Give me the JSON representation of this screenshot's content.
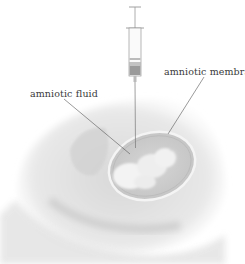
{
  "diagram": {
    "labels": [
      {
        "id": "amniotic-fluid",
        "text": "amniotic fluid"
      },
      {
        "id": "amniotic-membranes",
        "text": "amniotic membranes"
      }
    ],
    "elements": [
      "syringe",
      "needle",
      "uterus",
      "amniotic sac",
      "fetus",
      "abdomen cross-section"
    ],
    "colors": {
      "line": "#555555",
      "shading": "#bdbdbd",
      "background": "#ffffff"
    }
  }
}
